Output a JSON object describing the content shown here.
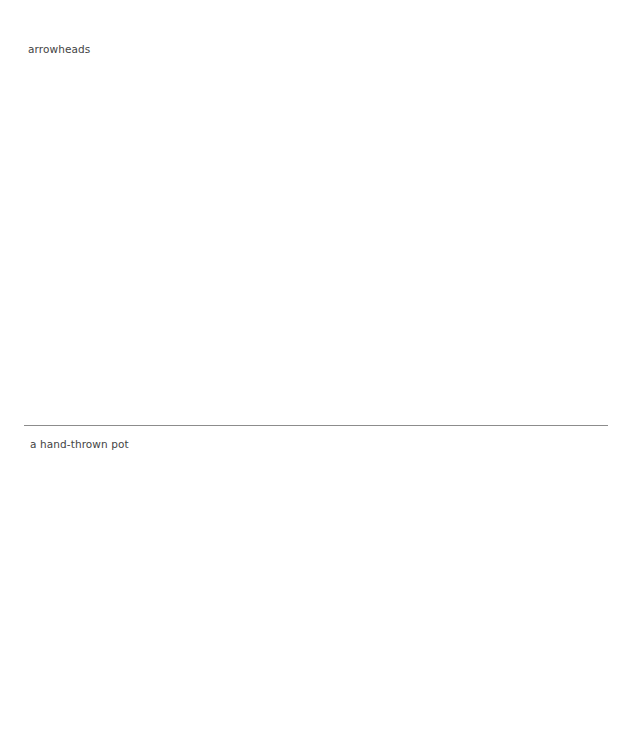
{
  "panels": [
    {
      "caption": "arrowheads",
      "image_subject": "arrowheads"
    },
    {
      "caption": "a hand-thrown pot",
      "image_subject": "hand-thrown pot"
    }
  ],
  "divider": {
    "color": "#8c8c8c"
  },
  "colors": {
    "background": "#ffffff",
    "caption_text": "#444444"
  }
}
